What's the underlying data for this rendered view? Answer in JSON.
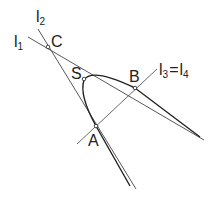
{
  "diagram": {
    "labels": {
      "l1": "l",
      "l1_sub": "1",
      "l2": "l",
      "l2_sub": "2",
      "l3l4": "l",
      "l3_sub": "3",
      "eq": "=",
      "l4": "l",
      "l4_sub": "4",
      "C": "C",
      "S": "S",
      "B": "B",
      "A": "A"
    },
    "points": {
      "C": [
        48,
        47
      ],
      "S": [
        84,
        79
      ],
      "B": [
        135,
        88
      ],
      "A": [
        96,
        126
      ]
    },
    "colors": {
      "line": "#333333",
      "curve": "#222222"
    }
  }
}
